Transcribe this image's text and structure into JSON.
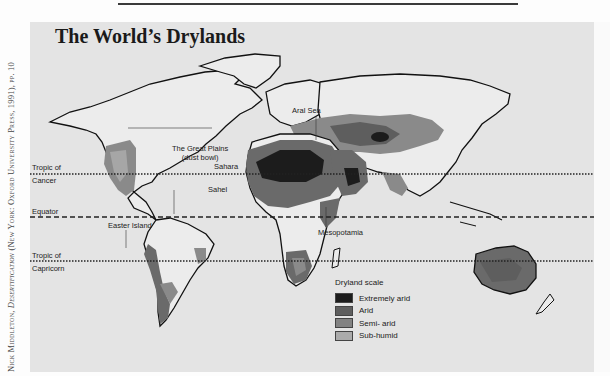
{
  "title": "The World’s Drylands",
  "credit": {
    "author": "Nick Middleton, ",
    "book": "Desertification",
    "rest": " (New York: Oxford University Press, 1991), pp. 10"
  },
  "reference_lines": {
    "tropic_cancer": {
      "line1": "Tropic of",
      "line2": "Cancer"
    },
    "equator": "Equator",
    "tropic_capricorn": {
      "line1": "Tropic of",
      "line2": "Capricorn"
    }
  },
  "annotations": {
    "great_plains": {
      "line1": "The Great Plains",
      "line2": "(dust bowl)"
    },
    "aral_sea": "Aral Sea",
    "sahara": "Sahara",
    "sahel": "Sahel",
    "easter_island": "Easter Island",
    "mesopotamia": "Mesopotamia"
  },
  "legend": {
    "title": "Dryland scale",
    "items": [
      {
        "label": "Extremely arid",
        "color": "#1c1c1c"
      },
      {
        "label": "Arid",
        "color": "#5e5e5e"
      },
      {
        "label": "Semi- arid",
        "color": "#828282"
      },
      {
        "label": "Sub-humid",
        "color": "#ababab"
      }
    ]
  },
  "colors": {
    "background": "#e4e4e4",
    "land": "#ececec",
    "coast": "#111111"
  }
}
